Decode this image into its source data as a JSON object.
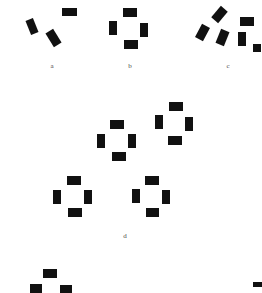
{
  "figure": {
    "width": 262,
    "height": 293,
    "background_color": "#ffffff",
    "mark_color": "#111111",
    "label_color": "#4a4a4a"
  },
  "labels": [
    {
      "text": "a",
      "x": 45,
      "y": 62
    },
    {
      "text": "b",
      "x": 123,
      "y": 62
    },
    {
      "text": "c",
      "x": 221,
      "y": 62
    },
    {
      "text": "d",
      "x": 118,
      "y": 232
    }
  ],
  "clusters": [
    {
      "id": "a",
      "label": "a",
      "count": 3,
      "marks": [
        {
          "x": 62,
          "y": 8,
          "w": 15,
          "h": 8,
          "rot": 0
        },
        {
          "x": 28,
          "y": 19,
          "w": 8,
          "h": 15,
          "rot": -22
        },
        {
          "x": 49,
          "y": 30,
          "w": 9,
          "h": 16,
          "rot": -32
        }
      ]
    },
    {
      "id": "b",
      "label": "b",
      "count": 4,
      "marks": [
        {
          "x": 123,
          "y": 8,
          "w": 14,
          "h": 9,
          "rot": 0
        },
        {
          "x": 109,
          "y": 21,
          "w": 8,
          "h": 14,
          "rot": 0
        },
        {
          "x": 140,
          "y": 23,
          "w": 8,
          "h": 14,
          "rot": 0
        },
        {
          "x": 124,
          "y": 40,
          "w": 14,
          "h": 9,
          "rot": 0
        }
      ]
    },
    {
      "id": "c",
      "label": "c",
      "count": 6,
      "marks": [
        {
          "x": 215,
          "y": 7,
          "w": 9,
          "h": 15,
          "rot": 40
        },
        {
          "x": 240,
          "y": 17,
          "w": 14,
          "h": 9,
          "rot": 0
        },
        {
          "x": 198,
          "y": 25,
          "w": 9,
          "h": 15,
          "rot": 28
        },
        {
          "x": 218,
          "y": 30,
          "w": 9,
          "h": 15,
          "rot": 22
        },
        {
          "x": 238,
          "y": 32,
          "w": 8,
          "h": 14,
          "rot": 0
        },
        {
          "x": 253,
          "y": 44,
          "w": 8,
          "h": 8,
          "rot": 0
        }
      ]
    },
    {
      "id": "d",
      "label": "d",
      "count": 16,
      "subgroups": [
        {
          "id": "d-top-center",
          "marks": [
            {
              "x": 110,
              "y": 120,
              "w": 14,
              "h": 9,
              "rot": 0
            },
            {
              "x": 97,
              "y": 134,
              "w": 8,
              "h": 14,
              "rot": 0
            },
            {
              "x": 128,
              "y": 134,
              "w": 8,
              "h": 14,
              "rot": 0
            },
            {
              "x": 112,
              "y": 152,
              "w": 14,
              "h": 9,
              "rot": 0
            }
          ]
        },
        {
          "id": "d-top-right",
          "marks": [
            {
              "x": 169,
              "y": 102,
              "w": 14,
              "h": 9,
              "rot": 0
            },
            {
              "x": 155,
              "y": 115,
              "w": 8,
              "h": 14,
              "rot": 0
            },
            {
              "x": 185,
              "y": 117,
              "w": 8,
              "h": 14,
              "rot": 0
            },
            {
              "x": 168,
              "y": 136,
              "w": 14,
              "h": 9,
              "rot": 0
            }
          ]
        },
        {
          "id": "d-bottom-left",
          "marks": [
            {
              "x": 67,
              "y": 176,
              "w": 14,
              "h": 9,
              "rot": 0
            },
            {
              "x": 53,
              "y": 190,
              "w": 8,
              "h": 14,
              "rot": 0
            },
            {
              "x": 84,
              "y": 190,
              "w": 8,
              "h": 14,
              "rot": 0
            },
            {
              "x": 68,
              "y": 208,
              "w": 14,
              "h": 9,
              "rot": 0
            }
          ]
        },
        {
          "id": "d-bottom-right",
          "marks": [
            {
              "x": 145,
              "y": 176,
              "w": 14,
              "h": 9,
              "rot": 0
            },
            {
              "x": 132,
              "y": 189,
              "w": 8,
              "h": 14,
              "rot": 0
            },
            {
              "x": 162,
              "y": 190,
              "w": 8,
              "h": 14,
              "rot": 0
            },
            {
              "x": 146,
              "y": 208,
              "w": 13,
              "h": 9,
              "rot": 0
            }
          ]
        }
      ]
    },
    {
      "id": "e-partial",
      "label": "",
      "count": 3,
      "marks": [
        {
          "x": 43,
          "y": 269,
          "w": 14,
          "h": 9,
          "rot": 0
        },
        {
          "x": 30,
          "y": 284,
          "w": 12,
          "h": 9,
          "rot": 0
        },
        {
          "x": 60,
          "y": 285,
          "w": 12,
          "h": 8,
          "rot": 0
        }
      ]
    },
    {
      "id": "corner-fragment",
      "label": "",
      "count": 1,
      "marks": [
        {
          "x": 253,
          "y": 282,
          "w": 9,
          "h": 5,
          "rot": 0
        }
      ]
    }
  ]
}
